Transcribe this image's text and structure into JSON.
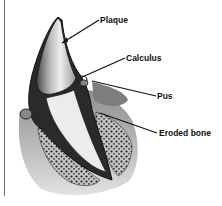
{
  "diagram": {
    "labels": [
      {
        "id": "plaque",
        "text": "Plaque",
        "x": 100,
        "y": 16
      },
      {
        "id": "calculus",
        "text": "Calculus",
        "x": 126,
        "y": 54
      },
      {
        "id": "pus",
        "text": "Pus",
        "x": 157,
        "y": 92
      },
      {
        "id": "eroded-bone",
        "text": "Eroded bone",
        "x": 159,
        "y": 129
      }
    ],
    "leader_lines": [
      {
        "label": "plaque",
        "from": [
          99,
          20
        ],
        "to": [
          62,
          43
        ]
      },
      {
        "label": "calculus",
        "from": [
          125,
          58
        ],
        "to": [
          80,
          78
        ]
      },
      {
        "label": "pus",
        "from": [
          156,
          96
        ],
        "to": [
          92,
          81
        ]
      },
      {
        "label": "eroded-bone",
        "from": [
          157,
          133
        ],
        "to": [
          100,
          113
        ]
      }
    ],
    "colors": {
      "line": "#111111",
      "enamel_light": "#f2f2f2",
      "enamel_shade": "#9a9a9a",
      "dark_tissue": "#2a2a2a",
      "gum": "#8c8c8c",
      "bone_bg": "#bdbdbd",
      "bone_dots": "#222222"
    }
  }
}
